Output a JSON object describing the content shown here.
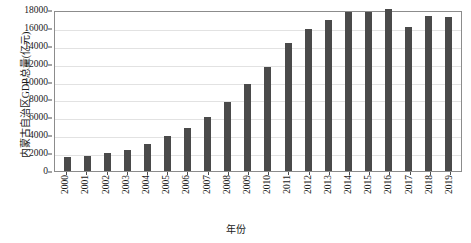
{
  "chart_data": {
    "type": "bar",
    "title": "",
    "xlabel": "年份",
    "ylabel": "内蒙古自治区GDP总量(亿元)",
    "categories": [
      "2000",
      "2001",
      "2002",
      "2003",
      "2004",
      "2005",
      "2006",
      "2007",
      "2008",
      "2009",
      "2010",
      "2011",
      "2012",
      "2013",
      "2014",
      "2015",
      "2016",
      "2017",
      "2018",
      "2019"
    ],
    "values": [
      1540,
      1715,
      1975,
      2388,
      3041,
      3896,
      4791,
      6091,
      7761,
      9740,
      11672,
      14360,
      15881,
      16917,
      17770,
      17832,
      18128,
      16103,
      17289,
      17213
    ],
    "ylim": [
      0,
      18000
    ],
    "ytick_labels": [
      "0",
      "2000",
      "4000",
      "6000",
      "8000",
      "10000",
      "12000",
      "14000",
      "16000",
      "18000"
    ],
    "ytick_values": [
      0,
      2000,
      4000,
      6000,
      8000,
      10000,
      12000,
      14000,
      16000,
      18000
    ],
    "grid": true,
    "legend": "none",
    "series_color": "#4a4a4a"
  }
}
